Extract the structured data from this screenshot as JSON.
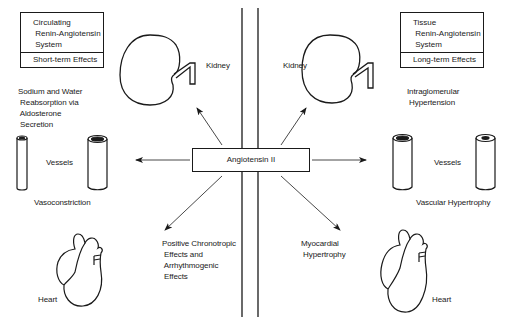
{
  "diagram": {
    "center": {
      "label": "Angiotensin II"
    },
    "left_system": {
      "title": "Circulating\n Renin-Angiotensin\n System",
      "effect": "Short-term Effects"
    },
    "right_system": {
      "title": "Tissue\n Renin-Angiotensin\n System",
      "effect": "Long-term Effects"
    },
    "organs": {
      "kidney_left": "Kidney",
      "kidney_right": "Kidney",
      "vessels_left": "Vessels",
      "vessels_right": "Vessels",
      "heart_left": "Heart",
      "heart_right": "Heart"
    },
    "effects": {
      "sodium": "Sodium and Water\n Reabsorption via\n Aldosterone\n Secretion",
      "intraglomerular": "Intraglomerular\n Hypertension",
      "vasoconstriction": "Vasoconstriction",
      "vascular_hypertrophy": "Vascular Hypertrophy",
      "chronotropic": "Positive Chronotropic\n Effects and\n Arrhythmogenic\n Effects",
      "myocardial": "Myocardial\n Hypertrophy"
    },
    "colors": {
      "line": "#1a1a1a",
      "background": "#ffffff"
    }
  }
}
